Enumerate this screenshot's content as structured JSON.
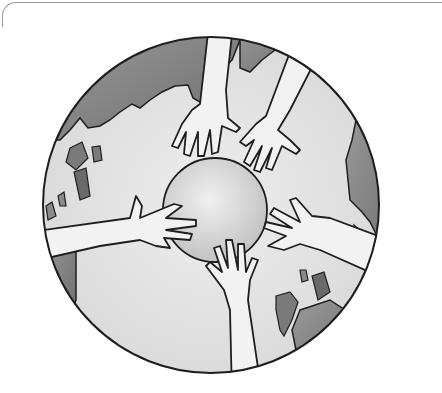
{
  "image": {
    "description": "Black and white illustration of five hands reaching toward a small globe at the center of a larger world globe",
    "alt_text": "Hands around the world",
    "colors": {
      "background": "#ffffff",
      "ocean_light": "#e6e6e6",
      "land_dark": "#8a8a8a",
      "outline": "#1e1e1e",
      "skin": "#f2f2f2",
      "frame": "#9a9a9a"
    }
  }
}
